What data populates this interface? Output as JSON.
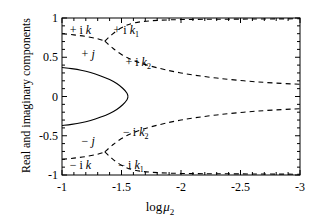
{
  "chart_data": {
    "type": "line",
    "title": "",
    "xlabel": "log μ₂",
    "ylabel": "Real and imaginary components",
    "xlim": [
      -1,
      -3
    ],
    "ylim": [
      -1,
      1
    ],
    "x_ticks": [
      -1,
      -1.5,
      -2,
      -2.5,
      -3
    ],
    "x_tick_labels": [
      "-1",
      "-1.5",
      "-2",
      "-2.5",
      "-3"
    ],
    "y_ticks": [
      1,
      0.5,
      0,
      -0.5,
      -1
    ],
    "y_tick_labels": [
      "1",
      "0.5",
      "0",
      "-0.5",
      "-1"
    ],
    "grid": false,
    "legend": "none (inline curve annotations)",
    "series": [
      {
        "name": "+j",
        "style": "solid",
        "annotation": "+ j",
        "annotation_xy": [
          -1.22,
          0.54
        ],
        "points": [
          [
            -1.0,
            0.37
          ],
          [
            -1.08,
            0.355
          ],
          [
            -1.16,
            0.335
          ],
          [
            -1.24,
            0.305
          ],
          [
            -1.32,
            0.265
          ],
          [
            -1.4,
            0.215
          ],
          [
            -1.46,
            0.165
          ],
          [
            -1.51,
            0.105
          ],
          [
            -1.545,
            0.045
          ],
          [
            -1.555,
            0.0
          ]
        ]
      },
      {
        "name": "-j",
        "style": "solid",
        "annotation": "− j",
        "annotation_xy": [
          -1.22,
          -0.57
        ],
        "points": [
          [
            -1.555,
            0.0
          ],
          [
            -1.545,
            -0.045
          ],
          [
            -1.51,
            -0.105
          ],
          [
            -1.46,
            -0.165
          ],
          [
            -1.4,
            -0.215
          ],
          [
            -1.32,
            -0.265
          ],
          [
            -1.24,
            -0.305
          ],
          [
            -1.16,
            -0.335
          ],
          [
            -1.08,
            -0.355
          ],
          [
            -1.0,
            -0.37
          ]
        ]
      },
      {
        "name": "+ik",
        "style": "dashed",
        "annotation": "+ i k",
        "annotation_xy": [
          -1.155,
          0.845
        ],
        "points": [
          [
            -1.0,
            0.8
          ],
          [
            -1.1,
            0.785
          ],
          [
            -1.2,
            0.765
          ],
          [
            -1.3,
            0.735
          ],
          [
            -1.36,
            0.705
          ]
        ]
      },
      {
        "name": "+ik1",
        "style": "dashed",
        "annotation": "+ i k₁",
        "annotation_xy": [
          -1.54,
          0.85
        ],
        "points": [
          [
            -1.36,
            0.705
          ],
          [
            -1.42,
            0.79
          ],
          [
            -1.5,
            0.875
          ],
          [
            -1.6,
            0.935
          ],
          [
            -1.75,
            0.965
          ],
          [
            -2.0,
            0.98
          ],
          [
            -2.4,
            0.985
          ],
          [
            -3.0,
            0.99
          ]
        ]
      },
      {
        "name": "+ik2",
        "style": "dashed",
        "annotation": "+ i k₂",
        "annotation_xy": [
          -1.64,
          0.44
        ],
        "points": [
          [
            -1.36,
            0.705
          ],
          [
            -1.42,
            0.625
          ],
          [
            -1.5,
            0.535
          ],
          [
            -1.6,
            0.46
          ],
          [
            -1.75,
            0.385
          ],
          [
            -2.0,
            0.3
          ],
          [
            -2.3,
            0.235
          ],
          [
            -2.65,
            0.185
          ],
          [
            -3.0,
            0.155
          ]
        ]
      },
      {
        "name": "-ik",
        "style": "dashed",
        "annotation": "− i k",
        "annotation_xy": [
          -1.155,
          -0.87
        ],
        "points": [
          [
            -1.0,
            -0.8
          ],
          [
            -1.1,
            -0.785
          ],
          [
            -1.2,
            -0.765
          ],
          [
            -1.3,
            -0.735
          ],
          [
            -1.36,
            -0.705
          ]
        ]
      },
      {
        "name": "-ik1",
        "style": "dashed",
        "annotation": "− i k₁",
        "annotation_xy": [
          -1.58,
          -0.87
        ],
        "points": [
          [
            -1.36,
            -0.705
          ],
          [
            -1.42,
            -0.79
          ],
          [
            -1.5,
            -0.875
          ],
          [
            -1.6,
            -0.935
          ],
          [
            -1.75,
            -0.965
          ],
          [
            -2.0,
            -0.98
          ],
          [
            -2.4,
            -0.985
          ],
          [
            -3.0,
            -0.99
          ]
        ]
      },
      {
        "name": "-ik2",
        "style": "dashed",
        "annotation": "− i k₂",
        "annotation_xy": [
          -1.62,
          -0.455
        ],
        "points": [
          [
            -1.36,
            -0.705
          ],
          [
            -1.42,
            -0.625
          ],
          [
            -1.5,
            -0.535
          ],
          [
            -1.6,
            -0.46
          ],
          [
            -1.75,
            -0.385
          ],
          [
            -2.0,
            -0.3
          ],
          [
            -2.3,
            -0.235
          ],
          [
            -2.65,
            -0.185
          ],
          [
            -3.0,
            -0.155
          ]
        ]
      }
    ],
    "colors": {
      "axis": "#000000",
      "curve": "#000000",
      "background": "#ffffff"
    }
  }
}
